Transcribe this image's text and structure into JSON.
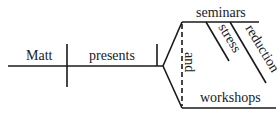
{
  "diagram": {
    "type": "sentence-diagram",
    "subject": "Matt",
    "verb": "presents",
    "conjunction": "and",
    "objects": [
      "seminars",
      "workshops"
    ],
    "modifiers": [
      "stress",
      "reduction"
    ],
    "line_color": "#1a1a1a"
  }
}
